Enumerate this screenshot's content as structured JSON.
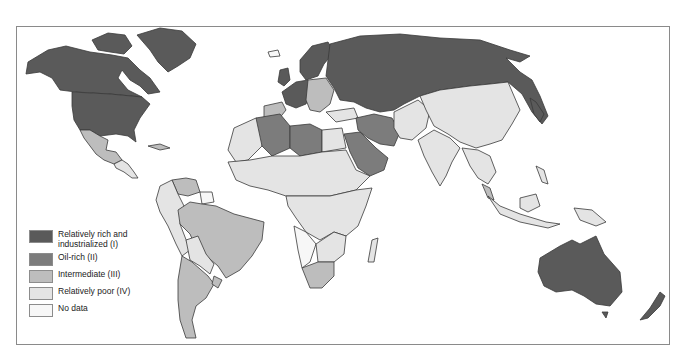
{
  "map": {
    "title": "",
    "legend": [
      {
        "key": "I",
        "label": "Relatively rich and industrialized (I)",
        "label_line1": "Relatively rich and",
        "label_line2": "industrialized (I)",
        "color": "#5a5a5a"
      },
      {
        "key": "II",
        "label": "Oil-rich (II)",
        "color": "#7c7c7c"
      },
      {
        "key": "III",
        "label": "Intermediate (III)",
        "color": "#bdbdbd"
      },
      {
        "key": "IV",
        "label": "Relatively poor (IV)",
        "color": "#e4e4e4"
      },
      {
        "key": "none",
        "label": "No data",
        "color": "#f7f7f7"
      }
    ],
    "regions": [
      {
        "name": "North America (USA, Canada)",
        "category": "I"
      },
      {
        "name": "Greenland",
        "category": "I"
      },
      {
        "name": "Western Europe",
        "category": "I"
      },
      {
        "name": "USSR",
        "category": "I"
      },
      {
        "name": "Japan",
        "category": "I"
      },
      {
        "name": "Australia",
        "category": "I"
      },
      {
        "name": "New Zealand",
        "category": "I"
      },
      {
        "name": "Eastern Europe",
        "category": "III"
      },
      {
        "name": "Iberia",
        "category": "III"
      },
      {
        "name": "Algeria",
        "category": "II"
      },
      {
        "name": "Libya",
        "category": "II"
      },
      {
        "name": "Saudi Arabia",
        "category": "II"
      },
      {
        "name": "Iran",
        "category": "II"
      },
      {
        "name": "Iraq",
        "category": "II"
      },
      {
        "name": "Mexico",
        "category": "III"
      },
      {
        "name": "Brazil",
        "category": "III"
      },
      {
        "name": "Argentina",
        "category": "III"
      },
      {
        "name": "Venezuela",
        "category": "III"
      },
      {
        "name": "South Africa",
        "category": "III"
      },
      {
        "name": "Malaysia",
        "category": "III"
      },
      {
        "name": "Africa (most)",
        "category": "IV"
      },
      {
        "name": "China",
        "category": "IV"
      },
      {
        "name": "India",
        "category": "IV"
      },
      {
        "name": "Southeast Asia",
        "category": "IV"
      },
      {
        "name": "Indonesia",
        "category": "IV"
      },
      {
        "name": "Andean South America",
        "category": "IV"
      },
      {
        "name": "Egypt",
        "category": "IV"
      },
      {
        "name": "Mongolia",
        "category": "IV"
      },
      {
        "name": "Angola / Namibia",
        "category": "none"
      }
    ]
  }
}
